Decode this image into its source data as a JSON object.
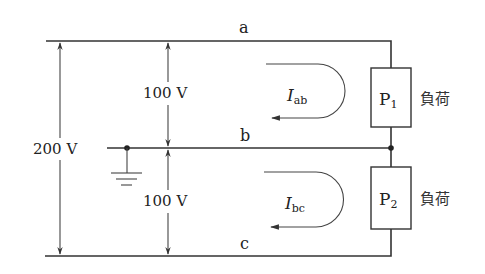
{
  "diagram": {
    "type": "single-phase three-wire circuit",
    "nodes": {
      "a": "a",
      "b": "b",
      "c": "c"
    },
    "voltages": {
      "total": "200 V",
      "upper": "100 V",
      "lower": "100 V"
    },
    "currents": {
      "ab": {
        "symbol": "I",
        "subscript": "ab"
      },
      "bc": {
        "symbol": "I",
        "subscript": "bc"
      }
    },
    "loads": [
      {
        "symbol": "P",
        "subscript": "1",
        "label": "負荷"
      },
      {
        "symbol": "P",
        "subscript": "2",
        "label": "負荷"
      }
    ],
    "ground": "ground-symbol",
    "colors": {
      "line": "#333333",
      "background": "#ffffff"
    }
  }
}
